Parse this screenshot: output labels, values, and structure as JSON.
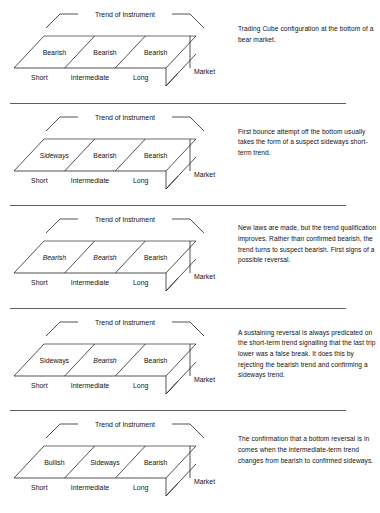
{
  "figure": {
    "common": {
      "trend_label": "Trend of Instrument",
      "market_label": "Market",
      "axis_labels": [
        "Short",
        "Intermediate",
        "Long"
      ]
    }
  },
  "panels": [
    {
      "id": "panel-1",
      "cells": [
        {
          "label": "Bearish",
          "style": "normal"
        },
        {
          "label": "Bearish",
          "style": "normal"
        },
        {
          "label": "Bearish",
          "style": "normal"
        }
      ],
      "trend_label": "Trend of Instrument",
      "market_label": "Market",
      "axis_labels": [
        "Short",
        "Intermediate",
        "Long"
      ],
      "caption": "Trading Cube configuration at the bottom of a bear market."
    },
    {
      "id": "panel-2",
      "cells": [
        {
          "label": "Sideways",
          "style": "italic"
        },
        {
          "label": "Bearish",
          "style": "normal"
        },
        {
          "label": "Bearish",
          "style": "normal"
        }
      ],
      "trend_label": "Trend of Instrument",
      "market_label": "Market",
      "axis_labels": [
        "Short",
        "Intermediate",
        "Long"
      ],
      "caption": "First bounce attempt off the bottom usually takes the form of a suspect sideways short-term trend."
    },
    {
      "id": "panel-3",
      "cells": [
        {
          "label": "Bearish",
          "style": "italic"
        },
        {
          "label": "Bearish",
          "style": "italic"
        },
        {
          "label": "Bearish",
          "style": "normal"
        }
      ],
      "trend_label": "Trend of Instrument",
      "market_label": "Market",
      "axis_labels": [
        "Short",
        "Intermediate",
        "Long"
      ],
      "caption": "New laws are made, but the trend qualification improves. Rather than confirmed bearish, the trend turns to suspect bearish. First signs of a possible reversal."
    },
    {
      "id": "panel-4",
      "cells": [
        {
          "label": "Sideways",
          "style": "normal"
        },
        {
          "label": "Bearish",
          "style": "italic"
        },
        {
          "label": "Bearish",
          "style": "normal"
        }
      ],
      "trend_label": "Trend of Instrument",
      "market_label": "Market",
      "axis_labels": [
        "Short",
        "Intermediate",
        "Long"
      ],
      "caption": "A sustaining reversal is always predicated on the short-term trend signalling that the last trip lower was a false break. It does this by rejecting the bearish trend and confirming a sideways trend."
    },
    {
      "id": "panel-5",
      "cells": [
        {
          "label": "Bullish",
          "style": "normal"
        },
        {
          "label": "Sideways",
          "style": "normal"
        },
        {
          "label": "Bearish",
          "style": "normal"
        }
      ],
      "trend_label": "Trend of Instrument",
      "market_label": "Market",
      "axis_labels": [
        "Short",
        "Intermediate",
        "Long"
      ],
      "caption": "The confirmation that a bottom reversal is in comes when the intermediate-term trend changes from bearish to confirmed sideways."
    }
  ],
  "colors": {
    "line": "#1a1a1a",
    "top_edge": "#6f6f6f",
    "divider": "#5d5d5d",
    "text": "#111111",
    "background": "#ffffff"
  }
}
